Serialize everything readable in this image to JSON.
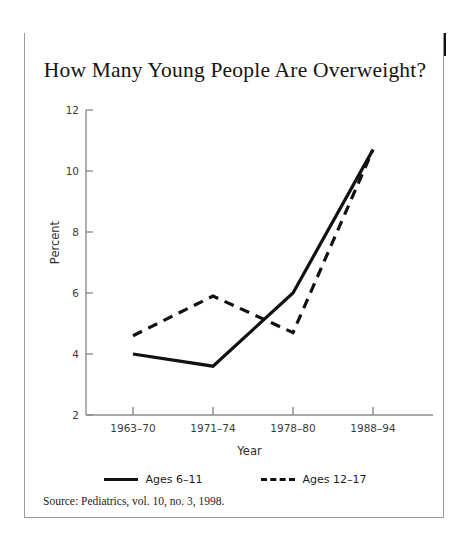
{
  "banner": {
    "label": "DID YOU KNOW?"
  },
  "chart_data": {
    "type": "line",
    "title": "How Many Young People Are Overweight?",
    "xlabel": "Year",
    "ylabel": "Percent",
    "categories": [
      "1963–70",
      "1971–74",
      "1978–80",
      "1988–94"
    ],
    "series": [
      {
        "name": "Ages 6–11",
        "style": "solid",
        "color": "#111111",
        "values": [
          4.0,
          3.6,
          6.0,
          10.7
        ]
      },
      {
        "name": "Ages 12–17",
        "style": "dashed",
        "color": "#111111",
        "values": [
          4.6,
          5.9,
          4.7,
          10.7
        ]
      }
    ],
    "ylim": [
      2,
      12
    ],
    "yticks": [
      2,
      4,
      6,
      8,
      10,
      12
    ],
    "ytick_labels": [
      "2",
      "4",
      "6",
      "8",
      "10",
      "12"
    ],
    "grid": false,
    "legend_position": "bottom"
  },
  "source": {
    "text": "Source:  Pediatrics, vol. 10, no. 3, 1998."
  }
}
